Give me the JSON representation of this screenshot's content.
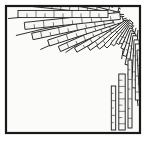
{
  "figure": {
    "title": "Radiating ruler-bar fan illustration",
    "medium": "line-art engraving",
    "canvas": {
      "width": 151,
      "height": 152
    },
    "colors": {
      "background": "#ffffff",
      "paper": "#fbfbf9",
      "ink": "#1a1a1a",
      "hatch": "#2b2b2b",
      "bar_fill": "#f7f7f5"
    },
    "frame": {
      "x": 6,
      "y": 6,
      "width": 134,
      "height": 127,
      "stroke_width": 2.2,
      "label": "image-border"
    },
    "focus": {
      "x": 138,
      "y": 14,
      "label": "convergence-point"
    },
    "bars": [
      {
        "a": 186.0,
        "r0": 24,
        "r1": 122,
        "w": 7.2,
        "ticks": 11
      },
      {
        "a": 190.5,
        "r0": 32,
        "r1": 126,
        "w": 6.6,
        "ticks": 10
      },
      {
        "a": 194.0,
        "r0": 20,
        "r1": 104,
        "w": 6.0,
        "ticks": 9
      },
      {
        "a": 197.5,
        "r0": 42,
        "r1": 130,
        "w": 6.8,
        "ticks": 11
      },
      {
        "a": 201.0,
        "r0": 26,
        "r1": 96,
        "w": 5.6,
        "ticks": 8
      },
      {
        "a": 204.5,
        "r0": 55,
        "r1": 132,
        "w": 6.4,
        "ticks": 10
      },
      {
        "a": 208.0,
        "r0": 22,
        "r1": 88,
        "w": 5.4,
        "ticks": 8
      },
      {
        "a": 211.5,
        "r0": 60,
        "r1": 128,
        "w": 6.2,
        "ticks": 9
      },
      {
        "a": 215.0,
        "r0": 28,
        "r1": 100,
        "w": 6.0,
        "ticks": 9
      },
      {
        "a": 218.5,
        "r0": 70,
        "r1": 134,
        "w": 6.6,
        "ticks": 9
      },
      {
        "a": 222.0,
        "r0": 30,
        "r1": 92,
        "w": 5.2,
        "ticks": 7
      },
      {
        "a": 225.5,
        "r0": 76,
        "r1": 138,
        "w": 6.8,
        "ticks": 9
      },
      {
        "a": 229.0,
        "r0": 34,
        "r1": 102,
        "w": 5.8,
        "ticks": 8
      },
      {
        "a": 232.5,
        "r0": 84,
        "r1": 142,
        "w": 6.4,
        "ticks": 8
      },
      {
        "a": 236.0,
        "r0": 38,
        "r1": 94,
        "w": 5.4,
        "ticks": 7
      },
      {
        "a": 239.5,
        "r0": 90,
        "r1": 146,
        "w": 6.6,
        "ticks": 8
      },
      {
        "a": 243.0,
        "r0": 42,
        "r1": 108,
        "w": 5.8,
        "ticks": 8
      },
      {
        "a": 246.5,
        "r0": 96,
        "r1": 150,
        "w": 6.2,
        "ticks": 8
      },
      {
        "a": 250.0,
        "r0": 46,
        "r1": 98,
        "w": 5.2,
        "ticks": 7
      },
      {
        "a": 253.5,
        "r0": 102,
        "r1": 152,
        "w": 6.0,
        "ticks": 7
      },
      {
        "a": 257.0,
        "r0": 50,
        "r1": 112,
        "w": 5.6,
        "ticks": 8
      },
      {
        "a": 260.5,
        "r0": 108,
        "r1": 156,
        "w": 6.2,
        "ticks": 7
      },
      {
        "a": 264.0,
        "r0": 54,
        "r1": 104,
        "w": 5.0,
        "ticks": 6
      },
      {
        "a": 267.5,
        "r0": 112,
        "r1": 158,
        "w": 5.8,
        "ticks": 7
      },
      {
        "a": 271.0,
        "r0": 58,
        "r1": 116,
        "w": 5.4,
        "ticks": 7
      },
      {
        "a": 150.0,
        "r0": 18,
        "r1": 72,
        "w": 5.0,
        "ticks": 6
      },
      {
        "a": 156.0,
        "r0": 22,
        "r1": 86,
        "w": 5.6,
        "ticks": 7
      },
      {
        "a": 162.0,
        "r0": 16,
        "r1": 94,
        "w": 6.2,
        "ticks": 8
      },
      {
        "a": 168.0,
        "r0": 26,
        "r1": 108,
        "w": 6.6,
        "ticks": 9
      },
      {
        "a": 174.0,
        "r0": 18,
        "r1": 114,
        "w": 7.0,
        "ticks": 10
      },
      {
        "a": 180.0,
        "r0": 30,
        "r1": 120,
        "w": 7.2,
        "ticks": 10
      },
      {
        "a": 145.0,
        "r0": 14,
        "r1": 60,
        "w": 4.6,
        "ticks": 5
      },
      {
        "a": 140.0,
        "r0": 12,
        "r1": 52,
        "w": 4.4,
        "ticks": 5
      },
      {
        "a": 135.0,
        "r0": 10,
        "r1": 46,
        "w": 4.2,
        "ticks": 4
      },
      {
        "a": 130.0,
        "r0": 10,
        "r1": 40,
        "w": 4.0,
        "ticks": 4
      },
      {
        "a": 125.0,
        "r0": 12,
        "r1": 36,
        "w": 3.8,
        "ticks": 3
      },
      {
        "a": 120.0,
        "r0": 14,
        "r1": 34,
        "w": 3.6,
        "ticks": 3
      },
      {
        "a": 114.0,
        "r0": 16,
        "r1": 38,
        "w": 3.8,
        "ticks": 3
      },
      {
        "a": 108.0,
        "r0": 18,
        "r1": 44,
        "w": 4.0,
        "ticks": 4
      },
      {
        "a": 102.0,
        "r0": 20,
        "r1": 52,
        "w": 4.4,
        "ticks": 5
      },
      {
        "a": 97.0,
        "r0": 22,
        "r1": 62,
        "w": 4.8,
        "ticks": 6
      },
      {
        "a": 93.0,
        "r0": 26,
        "r1": 74,
        "w": 5.2,
        "ticks": 6
      },
      {
        "a": 90.0,
        "r0": 30,
        "r1": 86,
        "w": 5.4,
        "ticks": 7
      },
      {
        "a": 87.0,
        "r0": 36,
        "r1": 98,
        "w": 5.8,
        "ticks": 8
      },
      {
        "a": 84.5,
        "r0": 44,
        "r1": 110,
        "w": 6.0,
        "ticks": 8
      },
      {
        "a": 82.5,
        "r0": 52,
        "r1": 118,
        "w": 6.2,
        "ticks": 9
      },
      {
        "a": 81.0,
        "r0": 62,
        "r1": 124,
        "w": 5.6,
        "ticks": 8
      },
      {
        "a": 79.5,
        "r0": 40,
        "r1": 92,
        "w": 4.6,
        "ticks": 6
      },
      {
        "a": 78.0,
        "r0": 70,
        "r1": 126,
        "w": 5.0,
        "ticks": 7
      },
      {
        "a": 276.0,
        "r0": 60,
        "r1": 120,
        "w": 5.0,
        "ticks": 7
      },
      {
        "a": 281.0,
        "r0": 64,
        "r1": 124,
        "w": 4.8,
        "ticks": 6
      },
      {
        "a": 286.0,
        "r0": 68,
        "r1": 118,
        "w": 4.6,
        "ticks": 6
      }
    ],
    "radial_lines": [
      {
        "a": 188.0,
        "r0": 18,
        "r1": 136
      },
      {
        "a": 196.0,
        "r0": 18,
        "r1": 138
      },
      {
        "a": 203.0,
        "r0": 18,
        "r1": 140
      },
      {
        "a": 210.0,
        "r0": 18,
        "r1": 142
      },
      {
        "a": 217.0,
        "r0": 18,
        "r1": 144
      },
      {
        "a": 224.0,
        "r0": 18,
        "r1": 146
      },
      {
        "a": 231.0,
        "r0": 18,
        "r1": 150
      },
      {
        "a": 238.0,
        "r0": 18,
        "r1": 152
      },
      {
        "a": 245.0,
        "r0": 18,
        "r1": 154
      },
      {
        "a": 252.0,
        "r0": 18,
        "r1": 156
      },
      {
        "a": 259.0,
        "r0": 16,
        "r1": 156
      },
      {
        "a": 266.0,
        "r0": 16,
        "r1": 152
      },
      {
        "a": 273.0,
        "r0": 16,
        "r1": 146
      },
      {
        "a": 280.0,
        "r0": 16,
        "r1": 140
      },
      {
        "a": 170.0,
        "r0": 14,
        "r1": 124
      },
      {
        "a": 178.0,
        "r0": 14,
        "r1": 130
      },
      {
        "a": 160.0,
        "r0": 12,
        "r1": 104
      },
      {
        "a": 152.0,
        "r0": 12,
        "r1": 82
      },
      {
        "a": 110.0,
        "r0": 12,
        "r1": 48
      },
      {
        "a": 98.0,
        "r0": 14,
        "r1": 66
      },
      {
        "a": 90.0,
        "r0": 16,
        "r1": 92
      },
      {
        "a": 84.0,
        "r0": 20,
        "r1": 116
      }
    ],
    "vertical_rulers": [
      {
        "x": 122.0,
        "y0": 74,
        "y1": 130,
        "w": 6.4,
        "ticks": 9,
        "label": "long-vertical-ruler"
      },
      {
        "x": 113.5,
        "y0": 86,
        "y1": 130,
        "w": 4.4,
        "ticks": 6,
        "label": "short-vertical-ruler"
      },
      {
        "x": 130.0,
        "y0": 60,
        "y1": 128,
        "w": 4.0,
        "ticks": 7,
        "label": "edge-vertical-ruler"
      }
    ],
    "caption": ""
  }
}
